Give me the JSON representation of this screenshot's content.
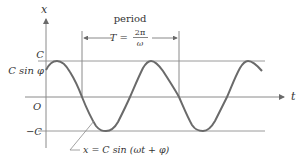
{
  "diagram": {
    "type": "sinusoid-oscillation",
    "colors": {
      "curve": "#6a6a6a",
      "axes": "#8a8a8a",
      "guides": "#a0a0a0",
      "text": "#333333",
      "background": "#ffffff"
    },
    "axes": {
      "vertical_label": "x",
      "horizontal_label": "t",
      "origin_label": "O"
    },
    "levels": {
      "upper_label": "C",
      "initial_label": "C sin φ",
      "lower_label": "−C"
    },
    "period": {
      "caption": "period",
      "lhs": "T =",
      "numerator": "2π",
      "denominator": "ω"
    },
    "equation": {
      "label": "x = C sin (ωt + φ)"
    }
  }
}
